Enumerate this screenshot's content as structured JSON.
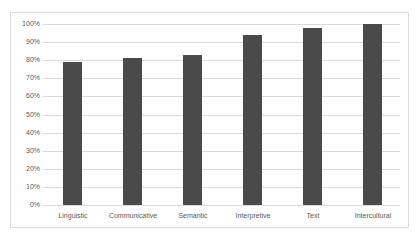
{
  "chart_data": {
    "type": "bar",
    "title": "",
    "xlabel": "",
    "ylabel": "",
    "categories": [
      "Linguistic",
      "Communicative",
      "Semantic",
      "Interpretive",
      "Text",
      "Intercultural"
    ],
    "values": [
      79,
      81,
      83,
      94,
      98,
      100
    ],
    "value_format": "percent",
    "ylim": [
      0,
      100
    ],
    "yticks": [
      0,
      10,
      20,
      30,
      40,
      50,
      60,
      70,
      80,
      90,
      100
    ],
    "ytick_labels": [
      "0%",
      "10%",
      "20%",
      "30%",
      "40%",
      "50%",
      "60%",
      "70%",
      "80%",
      "90%",
      "100%"
    ],
    "grid": true,
    "legend": null,
    "bar_color": "#4a4a4a"
  },
  "colors": {
    "bar": "#4a4a4a",
    "grid": "#d9d9d9",
    "text": "#595959",
    "frame": "#d9d9d9"
  }
}
